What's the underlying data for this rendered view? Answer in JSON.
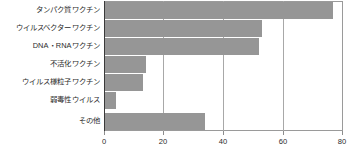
{
  "chart_data": {
    "type": "bar",
    "orientation": "horizontal",
    "title": "",
    "xlabel": "",
    "ylabel": "",
    "xlim": [
      0,
      80
    ],
    "ylim": null,
    "grid": true,
    "legend": false,
    "bar_color": "#969696",
    "axis_color": "#3a3a3a",
    "gridline_color": "#a8a8a8",
    "xticks": [
      0,
      20,
      40,
      60,
      80
    ],
    "xtick_labels": [
      "0",
      "20",
      "40",
      "60",
      "80"
    ],
    "categories": [
      "タンパク質ワクチン",
      "ウイルスベクターワクチン",
      "DNA・RNAワクチン",
      "不活化ワクチン",
      "ウイルス様粒子ワクチン",
      "弱毒性ウイルス",
      "その他"
    ],
    "values": [
      77,
      53,
      52,
      14,
      13,
      4,
      34
    ]
  }
}
